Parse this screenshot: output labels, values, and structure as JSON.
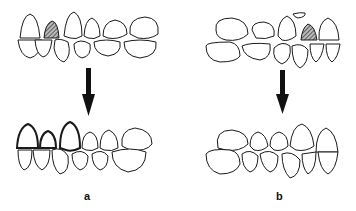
{
  "figure": {
    "panels": [
      {
        "id": "a",
        "label": "a",
        "description": "Before/after dental arch with hatched tooth replaced by bold-outlined teeth"
      },
      {
        "id": "b",
        "label": "b",
        "description": "Before/after dental arch with hatched tooth and displaced fragment, realigned after"
      }
    ],
    "arrow_direction": "down",
    "colors": {
      "stroke": "#1a1a1a",
      "hatch": "#555555",
      "background": "#ffffff"
    }
  }
}
